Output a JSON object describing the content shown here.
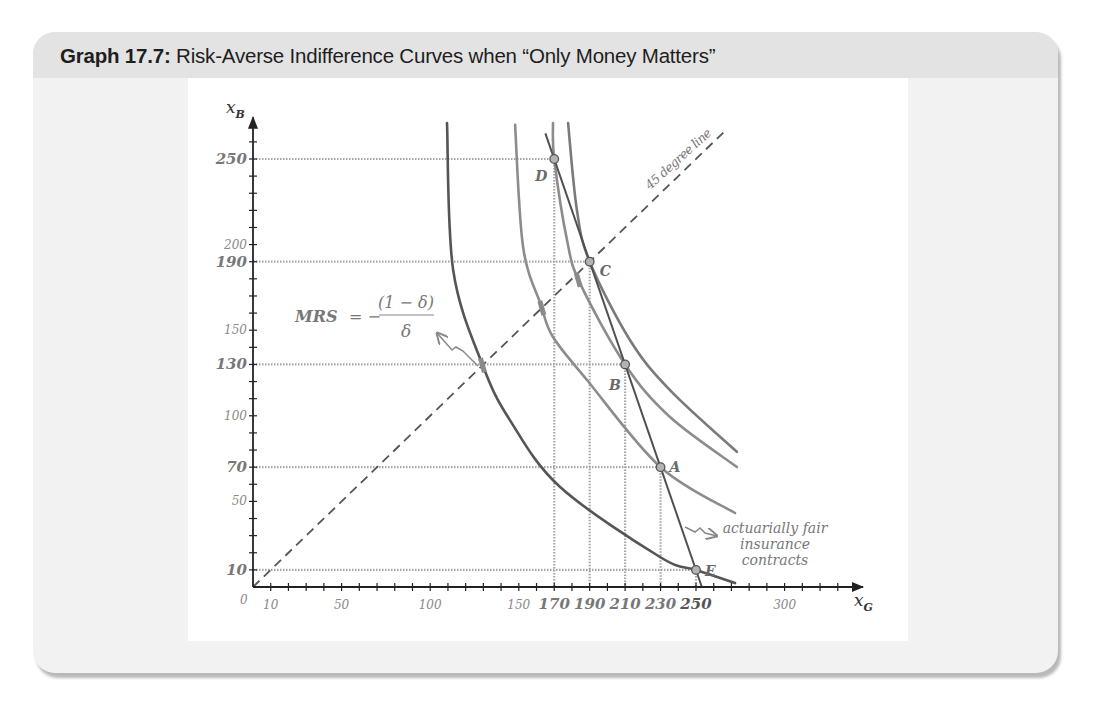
{
  "header": {
    "title_bold": "Graph 17.7:",
    "title_rest": " Risk-Averse Indifference Curves when “Only Money Matters”"
  },
  "chart_data": {
    "type": "line",
    "title": "Graph 17.7: Risk-Averse Indifference Curves when “Only Money Matters”",
    "xlabel": "x",
    "xlabel_sub": "G",
    "ylabel": "x",
    "ylabel_sub": "B",
    "origin_label": "0",
    "xlim": [
      0,
      342
    ],
    "ylim": [
      0,
      272
    ],
    "grid": false,
    "x_minor_tick_step": 10,
    "y_minor_tick_step": 10,
    "x_tick_labels": [
      {
        "value": 10,
        "label": "10",
        "style": "light"
      },
      {
        "value": 50,
        "label": "50",
        "style": "light"
      },
      {
        "value": 100,
        "label": "100",
        "style": "light"
      },
      {
        "value": 150,
        "label": "150",
        "style": "light"
      },
      {
        "value": 170,
        "label": "170",
        "style": "bold"
      },
      {
        "value": 190,
        "label": "190",
        "style": "bold"
      },
      {
        "value": 210,
        "label": "210",
        "style": "bold"
      },
      {
        "value": 230,
        "label": "230",
        "style": "bold"
      },
      {
        "value": 250,
        "label": "250",
        "style": "dark"
      },
      {
        "value": 300,
        "label": "300",
        "style": "light"
      }
    ],
    "y_tick_labels": [
      {
        "value": 10,
        "label": "10",
        "style": "bold"
      },
      {
        "value": 50,
        "label": "50",
        "style": "light"
      },
      {
        "value": 70,
        "label": "70",
        "style": "bold"
      },
      {
        "value": 100,
        "label": "100",
        "style": "light"
      },
      {
        "value": 130,
        "label": "130",
        "style": "bold"
      },
      {
        "value": 150,
        "label": "150",
        "style": "light"
      },
      {
        "value": 190,
        "label": "190",
        "style": "bold"
      },
      {
        "value": 200,
        "label": "200",
        "style": "light"
      },
      {
        "value": 250,
        "label": "250",
        "style": "bold"
      }
    ],
    "series": [
      {
        "name": "indifference curve through E",
        "role": "indifference",
        "color": "#555555",
        "points": [
          [
            109.5,
            271
          ],
          [
            113,
            185
          ],
          [
            129.8,
            129.1
          ],
          [
            145,
            97.5
          ],
          [
            173.3,
            58.4
          ],
          [
            229.7,
            17.5
          ],
          [
            250,
            10
          ],
          [
            272,
            2.3
          ]
        ]
      },
      {
        "name": "indifference curve through A",
        "role": "indifference",
        "color": "#8c8c8c",
        "points": [
          [
            147.9,
            270
          ],
          [
            152.4,
            198.6
          ],
          [
            162.5,
            164.7
          ],
          [
            169.3,
            146
          ],
          [
            188.5,
            120.9
          ],
          [
            230,
            70
          ],
          [
            272,
            43.2
          ]
        ]
      },
      {
        "name": "indifference curve through D and B",
        "role": "indifference",
        "color": "#8c8c8c",
        "points": [
          [
            169.3,
            271
          ],
          [
            170,
            250
          ],
          [
            177.2,
            202.7
          ],
          [
            184.5,
            177.6
          ],
          [
            210,
            130
          ],
          [
            235.3,
            99.3
          ],
          [
            273.1,
            70.1
          ]
        ]
      },
      {
        "name": "indifference curve through C",
        "role": "indifference",
        "color": "#7a7a7a",
        "points": [
          [
            177.8,
            271
          ],
          [
            182.8,
            220.2
          ],
          [
            190,
            190
          ],
          [
            212.7,
            144.3
          ],
          [
            235.3,
            115
          ],
          [
            273,
            79
          ]
        ]
      },
      {
        "name": "actuarially fair insurance contracts",
        "role": "budget",
        "color": "#505050",
        "points": [
          [
            165,
            265
          ],
          [
            253.3,
            0
          ]
        ]
      },
      {
        "name": "45 degree line",
        "role": "certainty",
        "color": "#555555",
        "points": [
          [
            0,
            0
          ],
          [
            267,
            267
          ]
        ]
      }
    ],
    "marked_points": [
      {
        "label": "D",
        "x": 170,
        "y": 250
      },
      {
        "label": "C",
        "x": 190,
        "y": 190
      },
      {
        "label": "B",
        "x": 210,
        "y": 130
      },
      {
        "label": "A",
        "x": 230,
        "y": 70
      },
      {
        "label": "E",
        "x": 250,
        "y": 10
      }
    ],
    "equal_slope_marks": [
      [
        129.5,
        129.5
      ],
      [
        163,
        163
      ],
      [
        183.5,
        179.5
      ]
    ],
    "annotations": {
      "mrs_lhs": "MRS",
      "mrs_eq": "= −",
      "mrs_numerator": "(1 − δ)",
      "mrs_denominator": "δ",
      "fair_label": [
        "actuarially fair",
        "insurance",
        "contracts"
      ],
      "diagonal_label": "45 degree line"
    }
  }
}
